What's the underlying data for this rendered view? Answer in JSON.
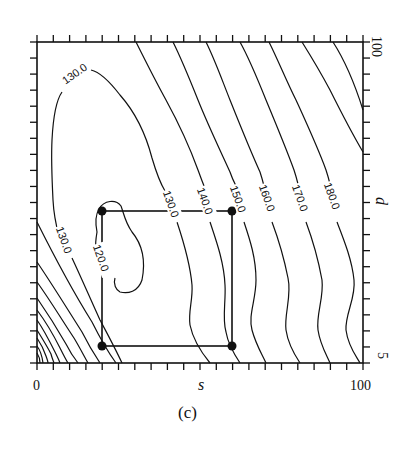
{
  "chart_data": {
    "type": "contour",
    "title": "",
    "caption": "(c)",
    "xlabel": "s",
    "ylabel": "d",
    "xlim": [
      0,
      100
    ],
    "ylim": [
      5,
      100
    ],
    "x_tick_labels": [
      "0",
      "100"
    ],
    "y_tick_labels": [
      "5",
      "100"
    ],
    "minor_ticks_per_axis": 20,
    "grid": false,
    "legend": null,
    "contour_levels": [
      120.0,
      130.0,
      140.0,
      150.0,
      160.0,
      170.0,
      180.0
    ],
    "contour_labels": [
      {
        "text": "130.0",
        "position": "upper-left",
        "s_approx": 14,
        "d_approx": 88
      },
      {
        "text": "130.0",
        "position": "left-middle",
        "s_approx": 9,
        "d_approx": 46
      },
      {
        "text": "120.0",
        "position": "inner-minimum",
        "s_approx": 22,
        "d_approx": 41
      },
      {
        "text": "130.0",
        "position": "top-of-box",
        "s_approx": 42,
        "d_approx": 65
      },
      {
        "text": "140.0",
        "position": "top-of-box",
        "s_approx": 51,
        "d_approx": 66
      },
      {
        "text": "150.0",
        "position": "box-corner",
        "s_approx": 61,
        "d_approx": 66
      },
      {
        "text": "160.0",
        "position": "right",
        "s_approx": 72,
        "d_approx": 67
      },
      {
        "text": "170.0",
        "position": "right",
        "s_approx": 82,
        "d_approx": 67
      },
      {
        "text": "180.0",
        "position": "right",
        "s_approx": 91,
        "d_approx": 67
      }
    ],
    "minimum_region": {
      "level": 120.0,
      "s_range": [
        19,
        34
      ],
      "d_range": [
        38,
        68
      ]
    },
    "lower_left_dense_contours": {
      "description": "many closely spaced contours (values > 130) near s=0, d=5",
      "count_approx": 10
    },
    "highlighted_region": {
      "shape": "rectangle",
      "corners": [
        {
          "s": 20,
          "d": 66
        },
        {
          "s": 60,
          "d": 66
        },
        {
          "s": 60,
          "d": 10
        },
        {
          "s": 20,
          "d": 10
        }
      ]
    }
  }
}
